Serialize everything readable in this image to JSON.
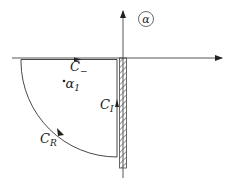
{
  "diagram": {
    "type": "complex-plane-contour",
    "plane_label": "α",
    "axes": {
      "horizontal": {
        "direction": "right",
        "arrow": true
      },
      "vertical": {
        "direction": "up",
        "arrow": true
      }
    },
    "branch_cut": {
      "description": "hatched strip along negative imaginary axis"
    },
    "contours": [
      {
        "id": "C_minus",
        "base": "C",
        "subscript": "−",
        "segment": "top edge along real axis",
        "arrow": "right"
      },
      {
        "id": "C_I",
        "base": "C",
        "subscript": "I",
        "segment": "vertical edge beside branch cut",
        "arrow": "up"
      },
      {
        "id": "C_R",
        "base": "C",
        "subscript": "R",
        "segment": "quarter-circle arc",
        "arrow": "down-right"
      }
    ],
    "points": [
      {
        "id": "alpha_1",
        "base": "α",
        "subscript": "1"
      }
    ],
    "colors": {
      "line": "#333333",
      "hatch": "#555555",
      "background": "#ffffff"
    }
  }
}
